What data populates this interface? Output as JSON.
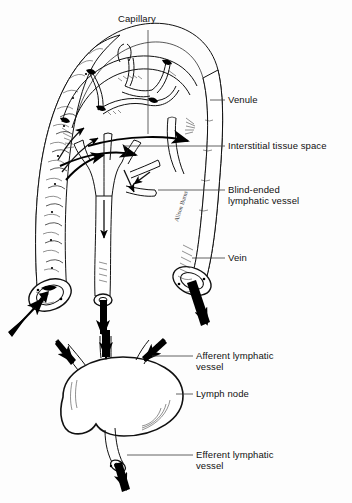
{
  "figure": {
    "background_color": "#fdfdfd",
    "ink_color": "#111111",
    "style": "black-and-white line drawing / medical illustration"
  },
  "labels": [
    {
      "id": "capillary",
      "text": "Capillary",
      "x": 118,
      "y": 18,
      "align": "left",
      "leader": "vertical-down"
    },
    {
      "id": "venule",
      "text": "Venule",
      "x": 228,
      "y": 95,
      "align": "left",
      "leader": "horizontal-left"
    },
    {
      "id": "interstitial",
      "text": "Interstitial tissue space",
      "x": 228,
      "y": 140,
      "align": "left",
      "leader": "horizontal-left"
    },
    {
      "id": "blind_ended",
      "text": "Blind-ended\nlymphatic vessel",
      "x": 228,
      "y": 184,
      "align": "left",
      "leader": "horizontal-left"
    },
    {
      "id": "vein",
      "text": "Vein",
      "x": 228,
      "y": 253,
      "align": "left",
      "leader": "horizontal-left"
    },
    {
      "id": "afferent",
      "text": "Afferent lymphatic\nvessel",
      "x": 196,
      "y": 351,
      "align": "left",
      "leader": "horizontal-left"
    },
    {
      "id": "lymph_node",
      "text": "Lymph node",
      "x": 196,
      "y": 389,
      "align": "left",
      "leader": "horizontal-left"
    },
    {
      "id": "efferent",
      "text": "Efferent lymphatic\nvessel",
      "x": 196,
      "y": 450,
      "align": "left",
      "leader": "horizontal-left"
    }
  ],
  "structures": [
    {
      "id": "artery",
      "name": "artery",
      "description": "thick textured muscular vessel on the left, open cross-section at lower end, blood entering"
    },
    {
      "id": "capillary-bed",
      "name": "capillary network",
      "description": "arched mesh of fine capillaries bridging artery and venule at top"
    },
    {
      "id": "venule",
      "name": "venule",
      "description": "smooth vessel on the right descending to the vein"
    },
    {
      "id": "vein",
      "name": "vein",
      "description": "right vessel with open elliptical cross-section, blood exiting"
    },
    {
      "id": "lymphatic-capillaries",
      "name": "blind-ended lymphatic vessel",
      "description": "central tree-like vessel with closed finger-like tips collecting interstitial fluid"
    },
    {
      "id": "interstitial-space",
      "name": "interstitial tissue space",
      "description": "open region between capillaries and lymphatics with fluid-flow arrows"
    },
    {
      "id": "lymph-node",
      "name": "lymph node",
      "description": "bean-shaped organ receiving three afferent vessels and emitting one efferent vessel"
    }
  ],
  "flow_arrows": [
    {
      "id": "arrow-artery-in",
      "label": "blood inflow",
      "direction": "up-right"
    },
    {
      "id": "arrow-vein-out",
      "label": "blood outflow",
      "direction": "down-right"
    },
    {
      "id": "arrow-lymph-down",
      "label": "lymph outflow",
      "direction": "down"
    },
    {
      "id": "arrow-interstitial-1",
      "label": "fluid into tissue",
      "direction": "right"
    },
    {
      "id": "arrow-interstitial-2",
      "label": "fluid into tissue",
      "direction": "right"
    },
    {
      "id": "arrow-afferent-1",
      "label": "lymph into node",
      "direction": "down-right"
    },
    {
      "id": "arrow-afferent-2",
      "label": "lymph into node",
      "direction": "down"
    },
    {
      "id": "arrow-afferent-3",
      "label": "lymph into node",
      "direction": "down-left"
    },
    {
      "id": "arrow-efferent",
      "label": "lymph out of node",
      "direction": "down"
    }
  ],
  "signature": {
    "text": "Alison Burns",
    "x": 178,
    "y": 222
  }
}
